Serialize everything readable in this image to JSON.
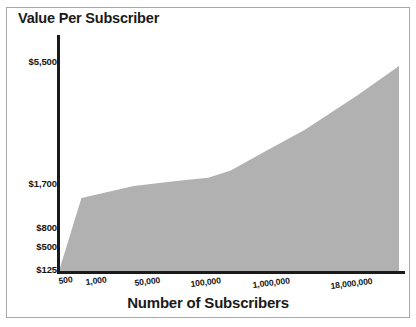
{
  "chart_data": {
    "type": "area",
    "title": "Value Per Subscriber",
    "xlabel": "Number of Subscribers",
    "ylabel": "",
    "grid": false,
    "legend": null,
    "x_scale": "log",
    "y_scale": "log",
    "xticklabels": [
      "500",
      "1,000",
      "50,000",
      "100,000",
      "1,000,000",
      "18,000,000"
    ],
    "yticklabels": [
      "$125",
      "$500",
      "$800",
      "$1,700",
      "$5,500"
    ],
    "ylim": [
      125,
      5500
    ],
    "xlim": [
      500,
      18000000
    ],
    "categories": [
      "500",
      "1,000",
      "50,000",
      "100,000",
      "1,000,000",
      "18,000,000"
    ],
    "values": [
      125,
      480,
      700,
      800,
      1700,
      5500
    ],
    "series": [
      {
        "name": "Value Per Subscriber",
        "x": [
          500,
          1000,
          5000,
          20000,
          50000,
          100000,
          300000,
          1000000,
          5000000,
          18000000
        ],
        "values": [
          125,
          480,
          600,
          660,
          700,
          800,
          1150,
          1700,
          3200,
          5500
        ]
      }
    ],
    "colors": {
      "area_fill": "#b1b1b1",
      "axis": "#1a1a1a",
      "text": "#141414",
      "frame": "#a8a8a8",
      "background": "#ffffff"
    },
    "annotations": []
  },
  "axes": {
    "y_ticks": [
      {
        "label": "$5,500",
        "top": 56
      },
      {
        "label": "$1,700",
        "top": 178
      },
      {
        "label": "$800",
        "top": 222
      },
      {
        "label": "$500",
        "top": 241
      },
      {
        "label": "$125",
        "top": 264
      }
    ],
    "x_ticks": [
      {
        "label": "500",
        "left": 58,
        "top": 276
      },
      {
        "label": "1,000",
        "left": 85,
        "top": 277
      },
      {
        "label": "50,000",
        "left": 134,
        "top": 278
      },
      {
        "label": "100,000",
        "left": 190,
        "top": 279
      },
      {
        "label": "1,000,000",
        "left": 252,
        "top": 280
      },
      {
        "label": "18,000,000",
        "left": 330,
        "top": 281
      }
    ]
  },
  "icons": {
    "area_series": "area-chart-series"
  }
}
